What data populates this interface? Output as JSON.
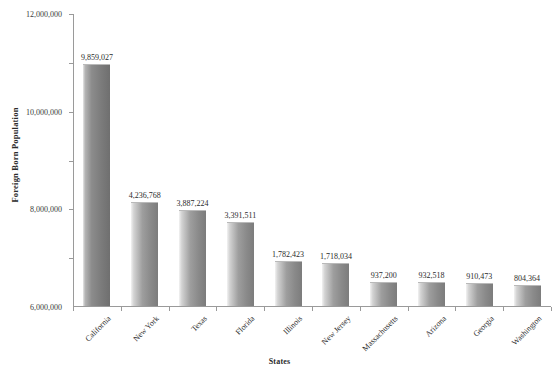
{
  "chart_data": {
    "type": "bar",
    "title": "",
    "xlabel": "States",
    "ylabel": "Foreign Born Population",
    "ylim": [
      0,
      12000000
    ],
    "grid": false,
    "legend": "none",
    "ytick_labels": [
      "12,000,000",
      "10,000,000",
      "8,000,000",
      "6,000,000",
      "4,000,000",
      "2,000,000"
    ],
    "ytick_values": [
      12000000,
      10000000,
      8000000,
      6000000,
      4000000,
      2000000
    ],
    "categories": [
      "California",
      "New York",
      "Texas",
      "Florida",
      "Illinois",
      "New Jersey",
      "Massachusetts",
      "Arizona",
      "Georgia",
      "Washington"
    ],
    "values": [
      9859027,
      4236768,
      3887224,
      3391511,
      1782423,
      1718034,
      937200,
      932518,
      910473,
      804364
    ],
    "value_labels": [
      "9,859,027",
      "4,236,768",
      "3,887,224",
      "3,391,511",
      "1,782,423",
      "1,718,034",
      "937,200",
      "932,518",
      "910,473",
      "804,364"
    ],
    "colors": {
      "bar_light": "#d3d3d3",
      "bar_mid": "#9e9e9e",
      "bar_dark": "#7c7c7c",
      "axis": "#9a9a9a",
      "text": "#2b2b2b",
      "background": "#ffffff"
    }
  }
}
